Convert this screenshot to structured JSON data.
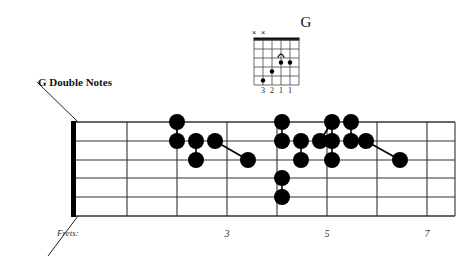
{
  "diagram": {
    "board_title": "G Double Notes",
    "frets_label": "Frets:",
    "fret_markers": [
      {
        "label": "3",
        "x": 227
      },
      {
        "label": "5",
        "x": 327
      },
      {
        "label": "7",
        "x": 427
      }
    ],
    "string_count": 6,
    "fret_count": 7,
    "nut_x": 73,
    "board_left": 73,
    "board_right": 455,
    "board_top": 122,
    "board_bottom": 216,
    "string_ys": [
      122,
      141,
      160,
      178,
      197,
      216
    ],
    "fret_xs": [
      73,
      127,
      177,
      227,
      277,
      327,
      377,
      427
    ],
    "dot_radius": 8,
    "dot_color": "#000000",
    "line_color": "#000000",
    "notes": [
      {
        "string": 1,
        "fret_x": 177,
        "y": 122
      },
      {
        "string": 2,
        "fret_x": 177,
        "y": 141
      },
      {
        "string": 2,
        "fret_x": 196,
        "y": 141
      },
      {
        "string": 3,
        "fret_x": 196,
        "y": 160
      },
      {
        "string": 2,
        "fret_x": 215,
        "y": 141
      },
      {
        "string": 3,
        "fret_x": 248,
        "y": 160
      },
      {
        "string": 1,
        "fret_x": 282,
        "y": 122
      },
      {
        "string": 2,
        "fret_x": 282,
        "y": 141
      },
      {
        "string": 4,
        "fret_x": 282,
        "y": 178
      },
      {
        "string": 5,
        "fret_x": 282,
        "y": 197
      },
      {
        "string": 2,
        "fret_x": 301,
        "y": 141
      },
      {
        "string": 3,
        "fret_x": 301,
        "y": 160
      },
      {
        "string": 2,
        "fret_x": 320,
        "y": 141
      },
      {
        "string": 1,
        "fret_x": 332,
        "y": 122
      },
      {
        "string": 2,
        "fret_x": 332,
        "y": 141
      },
      {
        "string": 3,
        "fret_x": 332,
        "y": 160
      },
      {
        "string": 1,
        "fret_x": 351,
        "y": 122
      },
      {
        "string": 2,
        "fret_x": 351,
        "y": 141
      },
      {
        "string": 2,
        "fret_x": 366,
        "y": 141
      },
      {
        "string": 3,
        "fret_x": 400,
        "y": 160
      }
    ],
    "connectors": [
      {
        "x1": 177,
        "y1": 122,
        "x2": 177,
        "y2": 141
      },
      {
        "x1": 196,
        "y1": 141,
        "x2": 196,
        "y2": 160
      },
      {
        "x1": 215,
        "y1": 141,
        "x2": 248,
        "y2": 160
      },
      {
        "x1": 282,
        "y1": 122,
        "x2": 282,
        "y2": 141
      },
      {
        "x1": 282,
        "y1": 178,
        "x2": 282,
        "y2": 197
      },
      {
        "x1": 301,
        "y1": 141,
        "x2": 301,
        "y2": 160
      },
      {
        "x1": 320,
        "y1": 141,
        "x2": 332,
        "y2": 122
      },
      {
        "x1": 332,
        "y1": 122,
        "x2": 332,
        "y2": 141
      },
      {
        "x1": 332,
        "y1": 141,
        "x2": 332,
        "y2": 160
      },
      {
        "x1": 351,
        "y1": 122,
        "x2": 351,
        "y2": 141
      },
      {
        "x1": 366,
        "y1": 141,
        "x2": 400,
        "y2": 160
      }
    ],
    "leader_lines": [
      {
        "x1": 37,
        "y1": 82,
        "x2": 78,
        "y2": 122
      },
      {
        "x1": 78,
        "y1": 216,
        "x2": 48,
        "y2": 256
      }
    ]
  },
  "chord_box": {
    "name": "G",
    "name_x": 276,
    "name_y": 14,
    "grid_left": 254,
    "grid_top": 40,
    "string_spacing": 9,
    "fret_spacing": 9,
    "strings": 6,
    "frets": 5,
    "muted_strings": [
      {
        "label": "×",
        "string_index": 0
      },
      {
        "label": "×",
        "string_index": 1
      }
    ],
    "dots": [
      {
        "string_index": 1,
        "fret": 5
      },
      {
        "string_index": 2,
        "fret": 4
      },
      {
        "string_index": 3,
        "fret": 3
      },
      {
        "string_index": 4,
        "fret": 3
      }
    ],
    "arch_marker": {
      "string_index": 3,
      "fret": 2
    },
    "finger_numbers": [
      "3",
      "2",
      "1",
      "1"
    ],
    "finger_number_strings": [
      1,
      2,
      3,
      4
    ]
  }
}
